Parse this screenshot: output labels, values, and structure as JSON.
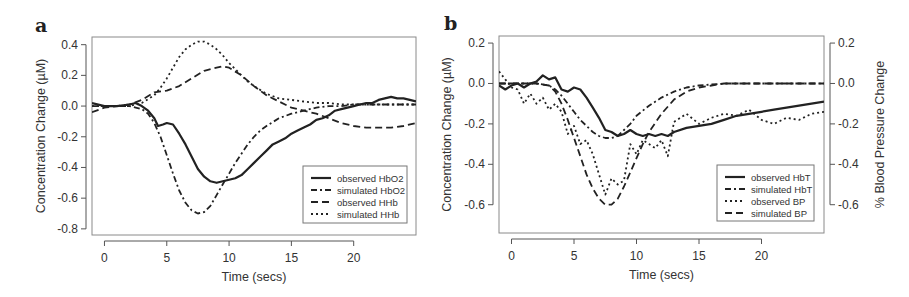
{
  "chart_data": [
    {
      "panel": "a",
      "type": "line",
      "title": "",
      "xlabel": "Time (secs)",
      "ylabel": "Concentration Change (µM)",
      "xlim": [
        -1,
        25
      ],
      "ylim": [
        -0.84,
        0.45
      ],
      "xticks": [
        0,
        5,
        10,
        15,
        20
      ],
      "yticks": [
        0.4,
        0.2,
        0.0,
        -0.2,
        -0.4,
        -0.6,
        -0.8
      ],
      "ytick_labels": [
        "0.4",
        "0.2",
        "0.0",
        "-0.2",
        "-0.4",
        "-0.6",
        "-0.8"
      ],
      "grid": false,
      "legend_position": "bottom-right",
      "series": [
        {
          "name": "observed HbO2",
          "style": "solid",
          "x": [
            -1,
            0,
            1,
            2,
            2.5,
            3,
            3.5,
            4,
            4.3,
            4.7,
            5,
            5.5,
            6,
            6.5,
            7,
            7.5,
            8,
            8.5,
            9,
            9.5,
            10,
            10.5,
            11,
            11.5,
            12,
            12.5,
            13,
            13.5,
            14,
            14.5,
            15,
            15.5,
            16,
            16.5,
            17,
            17.5,
            18,
            18.5,
            19,
            19.5,
            20,
            20.5,
            21,
            21.5,
            22,
            22.5,
            23,
            23.5,
            24,
            24.5,
            25
          ],
          "y": [
            0.02,
            0.0,
            0.0,
            0.01,
            0.02,
            0.0,
            -0.03,
            -0.08,
            -0.13,
            -0.12,
            -0.11,
            -0.12,
            -0.18,
            -0.25,
            -0.33,
            -0.41,
            -0.46,
            -0.49,
            -0.5,
            -0.49,
            -0.48,
            -0.47,
            -0.45,
            -0.41,
            -0.37,
            -0.33,
            -0.29,
            -0.25,
            -0.23,
            -0.21,
            -0.18,
            -0.16,
            -0.14,
            -0.12,
            -0.09,
            -0.08,
            -0.06,
            -0.03,
            -0.02,
            -0.01,
            0.0,
            0.01,
            0.02,
            0.02,
            0.04,
            0.05,
            0.06,
            0.05,
            0.05,
            0.04,
            0.03
          ]
        },
        {
          "name": "simulated HbO2",
          "style": "dashdot",
          "x": [
            -1,
            0,
            1,
            2,
            3,
            3.5,
            4,
            4.5,
            5,
            5.5,
            6,
            6.5,
            7,
            7.5,
            8,
            8.5,
            9,
            9.5,
            10,
            10.5,
            11,
            11.5,
            12,
            12.5,
            13,
            14,
            15,
            16,
            17,
            18,
            19,
            20,
            21,
            22,
            23,
            24,
            25
          ],
          "y": [
            0.0,
            0.0,
            0.0,
            0.0,
            -0.02,
            -0.05,
            -0.11,
            -0.2,
            -0.32,
            -0.44,
            -0.55,
            -0.63,
            -0.68,
            -0.7,
            -0.69,
            -0.65,
            -0.58,
            -0.51,
            -0.44,
            -0.37,
            -0.31,
            -0.25,
            -0.2,
            -0.16,
            -0.13,
            -0.08,
            -0.05,
            -0.03,
            -0.01,
            0.0,
            0.0,
            0.01,
            0.01,
            0.01,
            0.01,
            0.01,
            0.01
          ]
        },
        {
          "name": "observed HHb",
          "style": "dashed",
          "x": [
            -1,
            0,
            1,
            2,
            3,
            4,
            5,
            6,
            7,
            8,
            9,
            9.5,
            10,
            11,
            12,
            13,
            14,
            15,
            16,
            17,
            18,
            19,
            20,
            21,
            22,
            23,
            24,
            25
          ],
          "y": [
            -0.04,
            -0.01,
            0.0,
            0.01,
            0.04,
            0.09,
            0.1,
            0.13,
            0.18,
            0.23,
            0.25,
            0.26,
            0.25,
            0.2,
            0.13,
            0.07,
            0.03,
            -0.01,
            -0.03,
            -0.05,
            -0.08,
            -0.11,
            -0.13,
            -0.14,
            -0.14,
            -0.14,
            -0.13,
            -0.11
          ]
        },
        {
          "name": "simulated HHb",
          "style": "dotted",
          "x": [
            -1,
            0,
            1,
            2,
            3,
            4,
            4.5,
            5,
            5.5,
            6,
            6.5,
            7,
            7.5,
            8,
            8.5,
            9,
            9.5,
            10,
            10.5,
            11,
            11.5,
            12,
            13,
            14,
            15,
            16,
            17,
            18,
            19,
            20,
            21,
            22,
            23,
            24,
            25
          ],
          "y": [
            0.0,
            0.0,
            0.0,
            0.0,
            0.02,
            0.07,
            0.12,
            0.18,
            0.25,
            0.32,
            0.37,
            0.4,
            0.42,
            0.42,
            0.4,
            0.37,
            0.33,
            0.28,
            0.24,
            0.2,
            0.16,
            0.13,
            0.08,
            0.05,
            0.04,
            0.03,
            0.02,
            0.02,
            0.01,
            0.01,
            0.01,
            0.01,
            0.01,
            0.01,
            0.01
          ]
        }
      ]
    },
    {
      "panel": "b",
      "type": "line",
      "title": "",
      "xlabel": "Time (secs)",
      "ylabel": "Concentration Change (µM)",
      "ylabel_right": "% Blood Pressure Change",
      "xlim": [
        -1,
        25
      ],
      "ylim": [
        -0.74,
        0.235
      ],
      "ylim_right": [
        -0.74,
        0.235
      ],
      "xticks": [
        0,
        5,
        10,
        15,
        20
      ],
      "yticks": [
        0.2,
        0.0,
        -0.2,
        -0.4,
        -0.6
      ],
      "ytick_labels": [
        "0.2",
        "0.0",
        "-0.2",
        "-0.4",
        "-0.6"
      ],
      "yticks_right": [
        0.2,
        0.0,
        -0.2,
        -0.4,
        -0.6
      ],
      "ytick_labels_right": [
        "0.2",
        "0.0",
        "-0.2",
        "-0.4",
        "-0.6"
      ],
      "grid": false,
      "legend_position": "bottom-right",
      "series": [
        {
          "name": "observed HbT",
          "style": "solid",
          "x": [
            -1,
            -0.5,
            0,
            0.5,
            1,
            1.5,
            2,
            2.5,
            3,
            3.5,
            4,
            4.5,
            5,
            5.5,
            6,
            6.5,
            7,
            7.5,
            8,
            8.5,
            9,
            9.5,
            10,
            10.5,
            11,
            11.5,
            12,
            12.5,
            13,
            14,
            15,
            16,
            17,
            18,
            19,
            20,
            21,
            22,
            23,
            24,
            25
          ],
          "y": [
            -0.01,
            -0.03,
            -0.01,
            0.0,
            -0.02,
            0.0,
            0.01,
            0.04,
            0.02,
            0.03,
            -0.03,
            -0.04,
            -0.02,
            -0.03,
            -0.07,
            -0.12,
            -0.17,
            -0.23,
            -0.24,
            -0.26,
            -0.25,
            -0.23,
            -0.25,
            -0.26,
            -0.25,
            -0.26,
            -0.25,
            -0.26,
            -0.24,
            -0.22,
            -0.21,
            -0.2,
            -0.18,
            -0.16,
            -0.15,
            -0.14,
            -0.13,
            -0.12,
            -0.11,
            -0.1,
            -0.09
          ]
        },
        {
          "name": "simulated HbT",
          "style": "dashdot",
          "x": [
            -1,
            0,
            1,
            2,
            3,
            3.5,
            4,
            4.5,
            5,
            5.5,
            6,
            6.5,
            7,
            7.5,
            8,
            8.5,
            9,
            9.5,
            10,
            11,
            12,
            13,
            14,
            15,
            16,
            17,
            18,
            20,
            22,
            25
          ],
          "y": [
            0.0,
            0.0,
            0.0,
            0.0,
            -0.01,
            -0.03,
            -0.06,
            -0.1,
            -0.14,
            -0.18,
            -0.21,
            -0.24,
            -0.26,
            -0.27,
            -0.27,
            -0.26,
            -0.23,
            -0.2,
            -0.16,
            -0.11,
            -0.07,
            -0.04,
            -0.02,
            -0.01,
            -0.005,
            0.0,
            0.0,
            0.0,
            0.0,
            0.0
          ]
        },
        {
          "name": "observed BP",
          "style": "dotted",
          "x": [
            -1,
            -0.5,
            0,
            0.5,
            1,
            1.5,
            2,
            2.5,
            3,
            3.5,
            4,
            4.5,
            5,
            5.5,
            6,
            6.5,
            7,
            7.5,
            8,
            8.5,
            9,
            9.5,
            10,
            10.5,
            11,
            11.5,
            12,
            12.5,
            13,
            14,
            15,
            16,
            17,
            18,
            19,
            20,
            21,
            22,
            23,
            24,
            25
          ],
          "y": [
            0.06,
            0.02,
            -0.02,
            -0.03,
            -0.1,
            -0.05,
            -0.1,
            -0.07,
            -0.13,
            -0.1,
            -0.14,
            -0.25,
            -0.21,
            -0.3,
            -0.28,
            -0.35,
            -0.45,
            -0.55,
            -0.47,
            -0.5,
            -0.48,
            -0.3,
            -0.35,
            -0.28,
            -0.3,
            -0.32,
            -0.28,
            -0.36,
            -0.19,
            -0.15,
            -0.2,
            -0.17,
            -0.15,
            -0.16,
            -0.13,
            -0.18,
            -0.2,
            -0.17,
            -0.18,
            -0.15,
            -0.14
          ]
        },
        {
          "name": "simulated BP",
          "style": "dashed",
          "x": [
            -1,
            0,
            1,
            2,
            3,
            3.5,
            4,
            4.5,
            5,
            5.5,
            6,
            6.5,
            7,
            7.5,
            8,
            8.5,
            9,
            9.5,
            10,
            10.5,
            11,
            12,
            13,
            14,
            15,
            16,
            17,
            18,
            20,
            22,
            25
          ],
          "y": [
            0.0,
            0.0,
            0.0,
            0.0,
            -0.01,
            -0.04,
            -0.1,
            -0.18,
            -0.27,
            -0.36,
            -0.45,
            -0.52,
            -0.57,
            -0.6,
            -0.6,
            -0.57,
            -0.51,
            -0.44,
            -0.37,
            -0.3,
            -0.24,
            -0.15,
            -0.08,
            -0.04,
            -0.02,
            -0.01,
            0.0,
            0.0,
            0.0,
            0.0,
            0.0
          ]
        }
      ]
    }
  ]
}
